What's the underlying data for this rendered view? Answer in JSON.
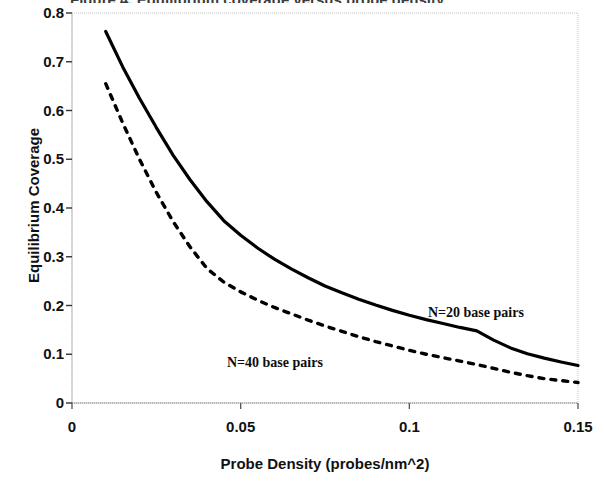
{
  "figure": {
    "title_cut_off": "Figure 4. Equilibrium coverage versus probe density",
    "background_color": "#ffffff",
    "ink_color": "#000000",
    "gridline_color": "#bfbfbf"
  },
  "chart_data": {
    "type": "line",
    "title": "",
    "xlabel": "Probe Density (probes/nm^2)",
    "ylabel": "Equilibrium Coverage",
    "xlim": [
      0,
      0.15
    ],
    "ylim": [
      0,
      0.8
    ],
    "xticks": [
      "0",
      "0.05",
      "0.1",
      "0.15"
    ],
    "xtick_values": [
      0,
      0.05,
      0.1,
      0.15
    ],
    "yticks": [
      "0",
      "0.1",
      "0.2",
      "0.3",
      "0.4",
      "0.5",
      "0.6",
      "0.7",
      "0.8"
    ],
    "ytick_values": [
      0,
      0.1,
      0.2,
      0.3,
      0.4,
      0.5,
      0.6,
      0.7,
      0.8
    ],
    "grid": false,
    "legend": "annotations-on-curves",
    "x": [
      0.01,
      0.015,
      0.02,
      0.025,
      0.03,
      0.035,
      0.04,
      0.045,
      0.05,
      0.055,
      0.06,
      0.065,
      0.07,
      0.075,
      0.08,
      0.085,
      0.09,
      0.095,
      0.1,
      0.105,
      0.11,
      0.115,
      0.12,
      0.125,
      0.13,
      0.135,
      0.14,
      0.145,
      0.15
    ],
    "series": [
      {
        "name": "N=20 base pairs",
        "style": "solid",
        "annotation": "N=20 base pairs",
        "values": [
          0.762,
          0.69,
          0.625,
          0.565,
          0.508,
          0.458,
          0.413,
          0.374,
          0.344,
          0.318,
          0.295,
          0.275,
          0.257,
          0.24,
          0.226,
          0.213,
          0.201,
          0.19,
          0.18,
          0.171,
          0.163,
          0.155,
          0.148,
          0.129,
          0.113,
          0.101,
          0.092,
          0.084,
          0.077
        ]
      },
      {
        "name": "N=40 base pairs",
        "style": "dashed",
        "annotation": "N=40 base pairs",
        "values": [
          0.655,
          0.575,
          0.5,
          0.432,
          0.372,
          0.32,
          0.276,
          0.248,
          0.228,
          0.211,
          0.196,
          0.183,
          0.17,
          0.158,
          0.147,
          0.136,
          0.126,
          0.117,
          0.108,
          0.1,
          0.093,
          0.086,
          0.079,
          0.071,
          0.063,
          0.056,
          0.05,
          0.046,
          0.042
        ]
      }
    ]
  },
  "annotations": {
    "n20": "N=20 base pairs",
    "n40": "N=40 base pairs"
  }
}
